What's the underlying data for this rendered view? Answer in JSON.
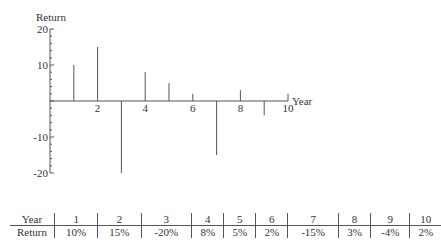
{
  "chart_data": {
    "type": "bar",
    "subtype": "stem",
    "title": "",
    "xlabel": "Year",
    "ylabel": "Return",
    "x": [
      1,
      2,
      3,
      4,
      5,
      6,
      7,
      8,
      9,
      10
    ],
    "values": [
      10,
      15,
      -20,
      8,
      5,
      2,
      -15,
      3,
      -4,
      2
    ],
    "xlim": [
      0,
      10
    ],
    "ylim": [
      -20,
      20
    ],
    "x_ticks": [
      "2",
      "4",
      "6",
      "8",
      "10"
    ],
    "y_ticks": [
      "20",
      "10",
      "-10",
      "-20"
    ],
    "grid": false,
    "legend": null
  },
  "table": {
    "header_label": "Year",
    "row_label": "Return",
    "years": [
      "1",
      "2",
      "3",
      "4",
      "5",
      "6",
      "7",
      "8",
      "9",
      "10"
    ],
    "returns": [
      "10%",
      "15%",
      "-20%",
      "8%",
      "5%",
      "2%",
      "-15%",
      "3%",
      "-4%",
      "2%"
    ]
  }
}
